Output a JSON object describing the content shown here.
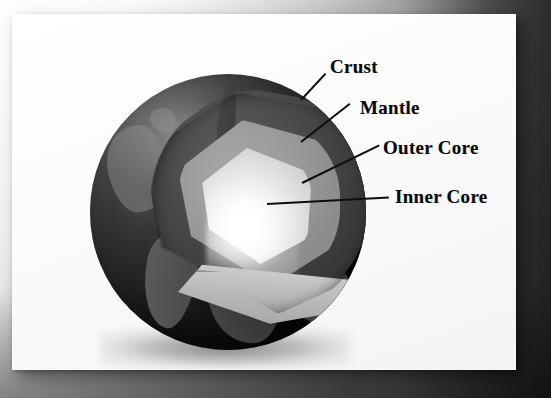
{
  "figure": {
    "background_color": "#b8b8b8",
    "card_color": "#fcfcfc"
  },
  "labels": [
    {
      "id": "crust",
      "text": "Crust",
      "color": "#0a0a0a",
      "x": 318,
      "y": 42,
      "leader": {
        "x": 289,
        "y": 85,
        "length": 36,
        "angle": -47
      }
    },
    {
      "id": "mantle",
      "text": "Mantle",
      "color": "#0a0a0a",
      "x": 348,
      "y": 83,
      "leader": {
        "x": 289,
        "y": 127,
        "length": 62,
        "angle": -38
      }
    },
    {
      "id": "outer-core",
      "text": "Outer Core",
      "color": "#0a0a0a",
      "x": 371,
      "y": 123,
      "leader": {
        "x": 290,
        "y": 168,
        "length": 86,
        "angle": -26
      }
    },
    {
      "id": "inner-core",
      "text": "Inner Core",
      "color": "#0a0a0a",
      "x": 383,
      "y": 172,
      "leader": {
        "x": 255,
        "y": 189,
        "length": 122,
        "angle": -3
      }
    }
  ],
  "layers": [
    {
      "id": "crust",
      "name": "Crust",
      "color": "#2a2a2a",
      "order": 1
    },
    {
      "id": "mantle",
      "name": "Mantle",
      "color": "#4a4a4a",
      "order": 2
    },
    {
      "id": "outer-core",
      "name": "Outer Core",
      "color": "#9b9b9b",
      "order": 3
    },
    {
      "id": "inner-core",
      "name": "Inner Core",
      "color": "#f2f2f2",
      "order": 4
    }
  ],
  "globe": {
    "surface_color": "#1d1d1d",
    "land_color": "#6a6a6a",
    "center_x": 214,
    "center_y": 198,
    "radius": 138
  },
  "continents": [
    {
      "id": "north-america",
      "left": 18,
      "top": 52,
      "width": 58,
      "height": 86,
      "rotate": -12,
      "radius": "58% 34% 52% 40% / 48% 46% 50% 54%"
    },
    {
      "id": "greenland",
      "left": 60,
      "top": 34,
      "width": 26,
      "height": 24,
      "rotate": 16,
      "radius": "56% 44% 38% 62% / 50% 58% 42% 50%"
    },
    {
      "id": "iceland",
      "left": 92,
      "top": 62,
      "width": 14,
      "height": 10,
      "rotate": 8,
      "radius": "50% 50% 50% 50% / 50% 50% 50% 50%"
    },
    {
      "id": "south-america",
      "left": 54,
      "top": 158,
      "width": 52,
      "height": 96,
      "rotate": 10,
      "radius": "46% 54% 40% 60% / 34% 40% 60% 66%"
    },
    {
      "id": "africa",
      "left": 118,
      "top": 176,
      "width": 74,
      "height": 94,
      "rotate": -6,
      "radius": "52% 48% 42% 58% / 44% 40% 60% 56%"
    },
    {
      "id": "europe",
      "left": 120,
      "top": 150,
      "width": 40,
      "height": 30,
      "rotate": 14,
      "radius": "48% 52% 56% 44% / 52% 48% 52% 48%"
    },
    {
      "id": "asia-east",
      "left": 196,
      "top": 188,
      "width": 66,
      "height": 60,
      "rotate": -18,
      "radius": "54% 46% 50% 50% / 42% 56% 44% 58%"
    },
    {
      "id": "australia",
      "left": 214,
      "top": 224,
      "width": 40,
      "height": 30,
      "rotate": 12,
      "radius": "50% 50% 46% 54% / 48% 52% 48% 52%"
    }
  ]
}
